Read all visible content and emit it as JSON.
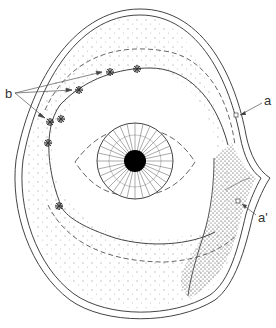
{
  "figure": {
    "labels": {
      "a": "a",
      "a_prime": "a'",
      "b": "b"
    },
    "colors": {
      "stroke": "#444444",
      "pupil": "#000000",
      "dots_light": "#aaaaaa",
      "dots_dense": "#333333",
      "background": "#ffffff"
    }
  }
}
